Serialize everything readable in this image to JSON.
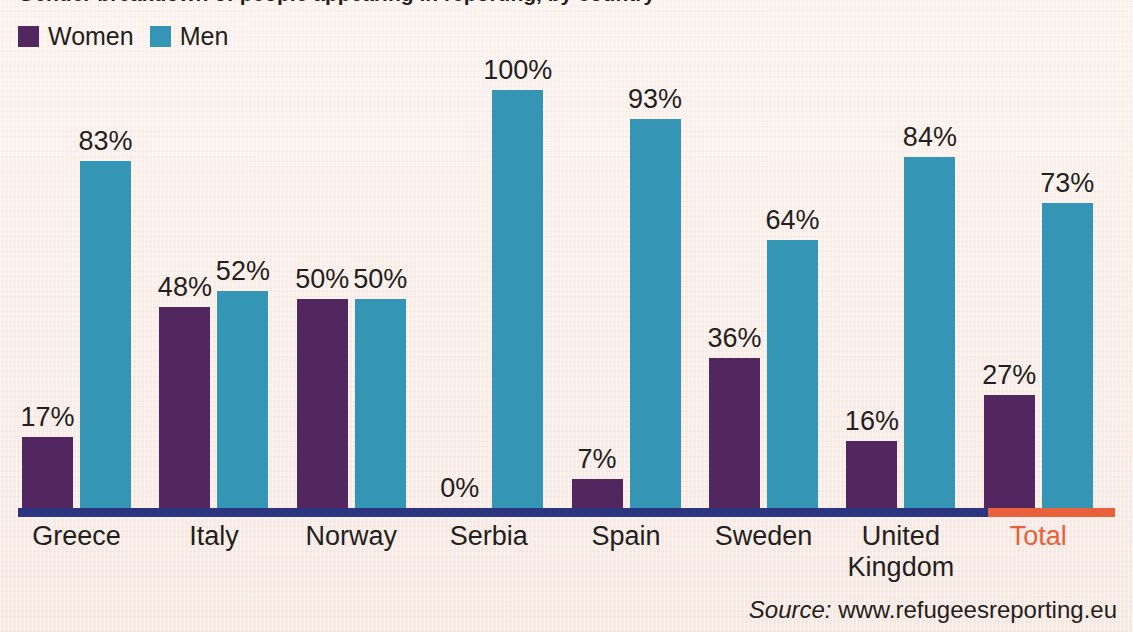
{
  "title": "Gender breakdown of people appearing in reporting, by country",
  "legend": {
    "items": [
      {
        "label": "Women",
        "color": "#52265e",
        "key": "women"
      },
      {
        "label": "Men",
        "color": "#3496b4",
        "key": "men"
      }
    ]
  },
  "axis": {
    "color": "#2b3580",
    "total_color": "#e8603c"
  },
  "source": {
    "prefix": "Source:",
    "url": "www.refugeesreporting.eu"
  },
  "chart_data": {
    "type": "bar",
    "title": "Gender breakdown of people appearing in reporting, by country",
    "xlabel": "",
    "ylabel": "",
    "ylim": [
      0,
      100
    ],
    "grid": false,
    "legend_position": "top-left",
    "value_suffix": "%",
    "categories": [
      "Greece",
      "Italy",
      "Norway",
      "Serbia",
      "Spain",
      "Sweden",
      "United Kingdom",
      "Total"
    ],
    "series": [
      {
        "name": "Women",
        "color": "#52265e",
        "values": [
          17,
          48,
          50,
          0,
          7,
          36,
          16,
          27
        ]
      },
      {
        "name": "Men",
        "color": "#3496b4",
        "values": [
          83,
          52,
          50,
          100,
          93,
          64,
          84,
          73
        ]
      }
    ],
    "data_labels": {
      "Women": [
        "17%",
        "48%",
        "50%",
        "0%",
        "7%",
        "36%",
        "16%",
        "27%"
      ],
      "Men": [
        "83%",
        "52%",
        "50%",
        "100%",
        "93%",
        "64%",
        "84%",
        "73%"
      ]
    },
    "highlight_category": "Total",
    "highlight_color": "#e8603c"
  },
  "category_labels": [
    {
      "text": "Greece",
      "lines": [
        "Greece"
      ]
    },
    {
      "text": "Italy",
      "lines": [
        "Italy"
      ]
    },
    {
      "text": "Norway",
      "lines": [
        "Norway"
      ]
    },
    {
      "text": "Serbia",
      "lines": [
        "Serbia"
      ]
    },
    {
      "text": "Spain",
      "lines": [
        "Spain"
      ]
    },
    {
      "text": "Sweden",
      "lines": [
        "Sweden"
      ]
    },
    {
      "text": "United Kingdom",
      "lines": [
        "United",
        "Kingdom"
      ]
    },
    {
      "text": "Total",
      "lines": [
        "Total"
      ]
    }
  ]
}
